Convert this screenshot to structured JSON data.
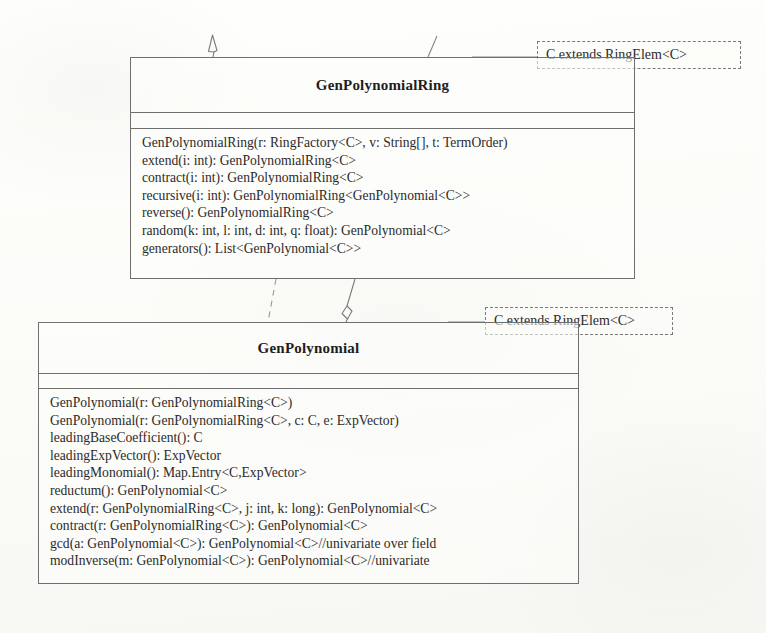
{
  "diagram": {
    "type": "uml-class-diagram",
    "background_color": "#fdfdfb",
    "line_color": "#6f6f6f",
    "text_color": "#2b2b2b"
  },
  "classes": [
    {
      "id": "genpolynomialring",
      "name": "GenPolynomialRing",
      "attributes": [],
      "operations": [
        "GenPolynomialRing(r: RingFactory<C>, v: String[], t: TermOrder)",
        "extend(i: int): GenPolynomialRing<C>",
        "contract(i: int): GenPolynomialRing<C>",
        "recursive(i: int): GenPolynomialRing<GenPolynomial<C>>",
        "reverse(): GenPolynomialRing<C>",
        "random(k: int, l: int, d: int, q: float): GenPolynomial<C>",
        "generators(): List<GenPolynomial<C>>"
      ]
    },
    {
      "id": "genpolynomial",
      "name": "GenPolynomial",
      "attributes": [],
      "operations": [
        "GenPolynomial(r: GenPolynomialRing<C>)",
        "GenPolynomial(r: GenPolynomialRing<C>, c: C, e: ExpVector)",
        "leadingBaseCoefficient(): C",
        "leadingExpVector(): ExpVector",
        "leadingMonomial(): Map.Entry<C,ExpVector>",
        "reductum(): GenPolynomial<C>",
        "extend(r: GenPolynomialRing<C>, j: int, k: long): GenPolynomial<C>",
        "contract(r: GenPolynomialRing<C>): GenPolynomial<C>",
        "gcd(a: GenPolynomial<C>): GenPolynomial<C>//univariate over field",
        "modInverse(m: GenPolynomial<C>): GenPolynomial<C>//univariate"
      ]
    }
  ],
  "template_parameters": [
    {
      "id": "template-ring",
      "label": "C extends RingElem<C>",
      "attached_to": "genpolynomialring"
    },
    {
      "id": "template-poly",
      "label": "C extends RingElem<C>",
      "attached_to": "genpolynomial"
    }
  ],
  "connectors": [
    {
      "id": "generalization-up-left",
      "style": "solid",
      "endpoint": "hollow-triangle-arrow",
      "direction": "up"
    },
    {
      "id": "association-up-right",
      "style": "solid",
      "endpoint": "none",
      "direction": "up"
    },
    {
      "id": "dependency-ring-to-poly",
      "style": "dashed",
      "endpoint": "none"
    },
    {
      "id": "aggregation-poly-to-ring",
      "style": "solid",
      "endpoint": "hollow-diamond"
    }
  ]
}
